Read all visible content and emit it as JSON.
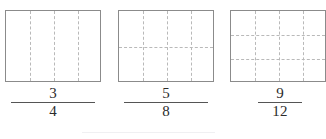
{
  "page": {
    "background_color": "#ffffff",
    "width": 322,
    "height": 139
  },
  "style": {
    "rect_border_color": "#8b8b8b",
    "grid_line_color": "#b9b9b9",
    "text_color": "#2b2b2b",
    "fraction_bar_color": "#555555",
    "bottom_rule_color": "#f0f0f2"
  },
  "figures": [
    {
      "id": "figure-1",
      "label": "three fourths",
      "rect": {
        "x": 5,
        "y": 10,
        "width": 96,
        "height": 72
      },
      "columns": 4,
      "rows": 1,
      "vertical_dividers": 3,
      "horizontal_dividers": 0,
      "total_parts": 4,
      "fraction": {
        "numerator": "3",
        "denominator": "4"
      },
      "fraction_pos": {
        "x": 5,
        "y": 86,
        "width": 96
      }
    },
    {
      "id": "figure-2",
      "label": "five eighths",
      "rect": {
        "x": 118,
        "y": 10,
        "width": 96,
        "height": 72
      },
      "columns": 4,
      "rows": 2,
      "vertical_dividers": 3,
      "horizontal_dividers": 1,
      "total_parts": 8,
      "fraction": {
        "numerator": "5",
        "denominator": "8"
      },
      "fraction_pos": {
        "x": 118,
        "y": 86,
        "width": 96
      }
    },
    {
      "id": "figure-3",
      "label": "nine twelfths",
      "rect": {
        "x": 230,
        "y": 10,
        "width": 96,
        "height": 72
      },
      "columns": 4,
      "rows": 3,
      "vertical_dividers": 3,
      "horizontal_dividers": 2,
      "total_parts": 12,
      "fraction": {
        "numerator": "9",
        "denominator": "12"
      },
      "fraction_pos": {
        "x": 255,
        "y": 86,
        "width": 50
      }
    }
  ],
  "bottom_rule": {
    "x": 82,
    "y": 132,
    "width": 133
  }
}
